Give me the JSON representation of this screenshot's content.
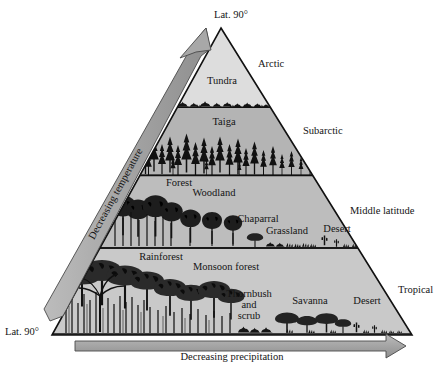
{
  "figure": {
    "type": "climate-biome-pyramid",
    "apex_label": "Lat. 90°",
    "base_left_label": "Lat. 90°",
    "axes": {
      "vertical_arrow_label": "Decreasing temperature",
      "horizontal_arrow_label": "Decreasing precipitation"
    },
    "zone_labels": [
      {
        "name": "Arctic",
        "text": "Arctic"
      },
      {
        "name": "Subarctic",
        "text": "Subarctic"
      },
      {
        "name": "Middle latitude",
        "text": "Middle latitude"
      },
      {
        "name": "Tropical",
        "text": "Tropical"
      }
    ],
    "bands": [
      {
        "zone": "Arctic",
        "fill": "#dddddd",
        "biomes": [
          {
            "label": "Tundra"
          }
        ]
      },
      {
        "zone": "Subarctic",
        "fill": "#b4b4b4",
        "biomes": [
          {
            "label": "Taiga"
          }
        ]
      },
      {
        "zone": "Middle latitude",
        "fill": "#bdbdbd",
        "biomes": [
          {
            "label": "Forest"
          },
          {
            "label": "Woodland"
          },
          {
            "label": "Chaparral"
          },
          {
            "label": "Grassland"
          },
          {
            "label": "Desert"
          }
        ]
      },
      {
        "zone": "Tropical",
        "fill": "#c9c9c9",
        "biomes": [
          {
            "label": "Rainforest"
          },
          {
            "label": "Monsoon forest"
          },
          {
            "label": "Thornbush"
          },
          {
            "label": "and"
          },
          {
            "label": "scrub"
          },
          {
            "label": "Savanna"
          },
          {
            "label": "Desert"
          }
        ]
      }
    ],
    "colors": {
      "outline": "#111111",
      "arrow_fill": "#a8a8a8",
      "arrow_stroke": "#4a4a4a",
      "background": "#ffffff",
      "text": "#141414"
    }
  }
}
